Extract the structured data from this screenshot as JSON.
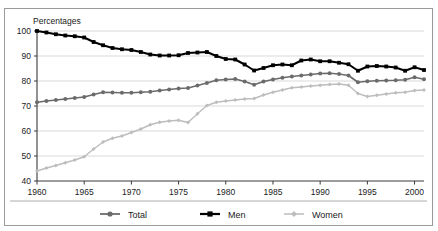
{
  "top_strip": {
    "text": ""
  },
  "chart_panel": {
    "axis_label": "Percentages",
    "legend": [
      {
        "name": "Total",
        "color": "#6b6b6b",
        "marker": "circle"
      },
      {
        "name": "Men",
        "color": "#000000",
        "marker": "square"
      },
      {
        "name": "Women",
        "color": "#bdbdbd",
        "marker": "diamond"
      }
    ]
  },
  "chart_data": {
    "type": "line",
    "title": "",
    "subtitle": "",
    "xlabel": "",
    "ylabel": "Percentages",
    "xlim": [
      1960,
      2001
    ],
    "ylim": [
      40,
      100
    ],
    "yticks": [
      40,
      50,
      60,
      70,
      80,
      90,
      100
    ],
    "ytick_labels": [
      "40",
      "50",
      "60",
      "70",
      "80",
      "90",
      "100"
    ],
    "xticks": [
      1960,
      1965,
      1970,
      1975,
      1980,
      1985,
      1990,
      1995,
      2000
    ],
    "xtick_labels": [
      "1960",
      "1965",
      "1970",
      "1975",
      "1980",
      "1985",
      "1990",
      "1995",
      "2000"
    ],
    "grid": "horizontal",
    "legend_position": "bottom",
    "x": [
      1960,
      1961,
      1962,
      1963,
      1964,
      1965,
      1966,
      1967,
      1968,
      1969,
      1970,
      1971,
      1972,
      1973,
      1974,
      1975,
      1976,
      1977,
      1978,
      1979,
      1980,
      1981,
      1982,
      1983,
      1984,
      1985,
      1986,
      1987,
      1988,
      1989,
      1990,
      1991,
      1992,
      1993,
      1994,
      1995,
      1996,
      1997,
      1998,
      1999,
      2000,
      2001
    ],
    "series": [
      {
        "name": "Total",
        "color": "#6b6b6b",
        "marker": "circle",
        "values": [
          71.5,
          72.0,
          72.4,
          72.8,
          73.2,
          73.6,
          74.6,
          75.5,
          75.4,
          75.3,
          75.3,
          75.5,
          75.7,
          76.2,
          76.6,
          77.0,
          77.2,
          78.2,
          79.2,
          80.3,
          80.6,
          80.8,
          79.8,
          78.5,
          79.8,
          80.6,
          81.3,
          81.8,
          82.2,
          82.6,
          83.0,
          83.1,
          82.8,
          82.2,
          79.5,
          79.9,
          80.1,
          80.2,
          80.3,
          80.5,
          81.5,
          80.7
        ]
      },
      {
        "name": "Men",
        "color": "#000000",
        "marker": "square",
        "values": [
          100.0,
          99.4,
          98.7,
          98.2,
          97.9,
          97.4,
          95.6,
          94.3,
          93.2,
          92.7,
          92.4,
          91.6,
          90.6,
          90.2,
          90.2,
          90.3,
          91.2,
          91.4,
          91.6,
          90.0,
          88.8,
          88.6,
          86.6,
          84.2,
          85.2,
          86.3,
          86.6,
          86.3,
          88.2,
          88.6,
          87.9,
          87.9,
          87.3,
          86.7,
          84.1,
          85.8,
          86.0,
          85.8,
          85.4,
          84.1,
          85.5,
          84.4
        ]
      },
      {
        "name": "Women",
        "color": "#bdbdbd",
        "marker": "diamond",
        "values": [
          44.0,
          45.2,
          46.2,
          47.3,
          48.4,
          49.7,
          52.8,
          55.6,
          57.1,
          58.0,
          59.4,
          60.8,
          62.5,
          63.5,
          64.0,
          64.3,
          63.4,
          66.9,
          70.2,
          71.5,
          72.0,
          72.4,
          72.8,
          73.0,
          74.4,
          75.5,
          76.4,
          77.3,
          77.6,
          78.0,
          78.3,
          78.6,
          78.8,
          78.3,
          75.0,
          73.8,
          74.3,
          74.8,
          75.3,
          75.5,
          76.2,
          76.4
        ]
      }
    ]
  }
}
